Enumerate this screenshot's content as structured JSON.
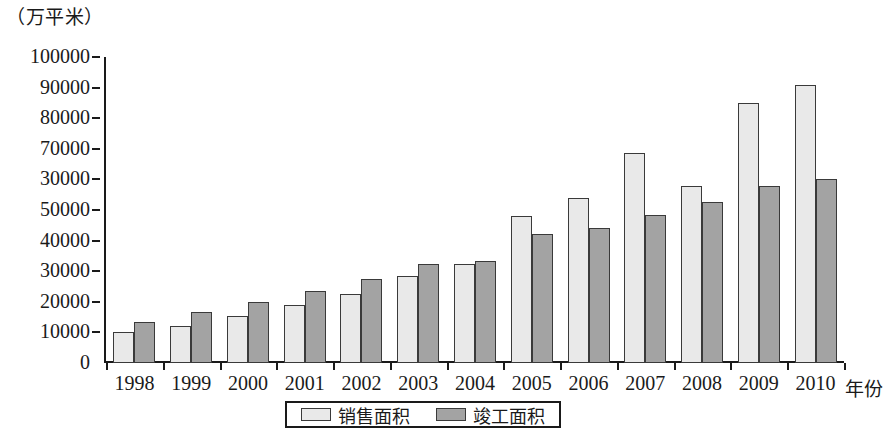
{
  "chart_data": {
    "type": "bar",
    "title": "",
    "unit_caption": "（万平米）",
    "xlabel": "年份",
    "ylabel": "",
    "ylim": [
      0,
      100000
    ],
    "ytick_step": 10000,
    "grid": false,
    "legend_position": "bottom-center",
    "categories": [
      "1998",
      "1999",
      "2000",
      "2001",
      "2002",
      "2003",
      "2004",
      "2005",
      "2006",
      "2007",
      "2008",
      "2009",
      "2010"
    ],
    "ytick_labels": [
      "100000",
      "90000",
      "80000",
      "70000",
      "30000",
      "50000",
      "40000",
      "30000",
      "20000",
      "10000",
      "0"
    ],
    "ytick_values": [
      100000,
      90000,
      80000,
      70000,
      60000,
      50000,
      40000,
      30000,
      20000,
      10000,
      0
    ],
    "series": [
      {
        "name": "销售面积",
        "color": "#e9e9e9",
        "values": [
          10000,
          12000,
          15500,
          19000,
          22500,
          28500,
          32500,
          48000,
          54000,
          68500,
          58000,
          85000,
          91000
        ]
      },
      {
        "name": "竣工面积",
        "color": "#a3a3a3",
        "values": [
          13500,
          16800,
          20000,
          23500,
          27500,
          32500,
          33500,
          42000,
          44000,
          48500,
          52500,
          58000,
          60000
        ]
      }
    ]
  },
  "legend": {
    "entries": [
      {
        "label": "销售面积",
        "swatch": "sales"
      },
      {
        "label": "竣工面积",
        "swatch": "completed"
      }
    ]
  }
}
